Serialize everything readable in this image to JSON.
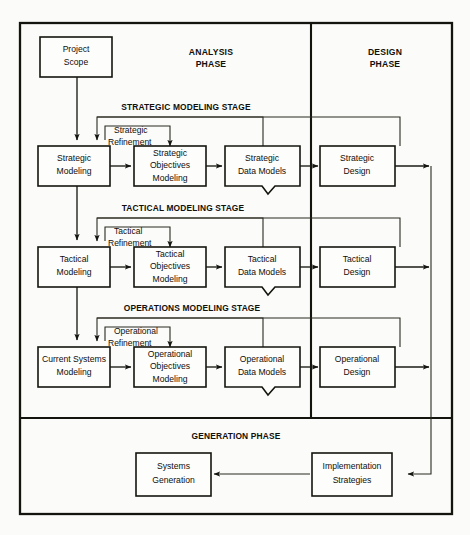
{
  "diagram": {
    "colors": {
      "background": "#fbfbf9",
      "box_fill": "#fdfdfb",
      "line": "#14140f",
      "text": "#100f0b"
    },
    "phases": [
      {
        "id": "analysis",
        "line1": "ANALYSIS",
        "line2": "PHASE"
      },
      {
        "id": "design",
        "line1": "DESIGN",
        "line2": "PHASE"
      }
    ],
    "generation_phase_label": "GENERATION PHASE",
    "stages": [
      {
        "id": "strategic",
        "label": "STRATEGIC MODELING STAGE"
      },
      {
        "id": "tactical",
        "label": "TACTICAL MODELING STAGE"
      },
      {
        "id": "operations",
        "label": "OPERATIONS MODELING STAGE"
      }
    ],
    "refinement_labels": [
      {
        "id": "strategic-refinement",
        "line1": "Strategic",
        "line2": "Refinement"
      },
      {
        "id": "tactical-refinement",
        "line1": "Tactical",
        "line2": "Refinement"
      },
      {
        "id": "operational-refinement",
        "line1": "Operational",
        "line2": "Refinement"
      }
    ],
    "start_box": {
      "id": "project-scope",
      "line1": "Project",
      "line2": "Scope"
    },
    "rows": [
      {
        "id": "strategic-row",
        "modeling": {
          "id": "strategic-modeling",
          "line1": "Strategic",
          "line2": "Modeling",
          "line3": ""
        },
        "objectives": {
          "id": "strategic-objectives-modeling",
          "line1": "Strategic",
          "line2": "Objectives",
          "line3": "Modeling"
        },
        "data_models": {
          "id": "strategic-data-models",
          "line1": "Strategic",
          "line2": "Data Models",
          "line3": ""
        },
        "design": {
          "id": "strategic-design",
          "line1": "Strategic",
          "line2": "Design",
          "line3": ""
        }
      },
      {
        "id": "tactical-row",
        "modeling": {
          "id": "tactical-modeling",
          "line1": "Tactical",
          "line2": "Modeling",
          "line3": ""
        },
        "objectives": {
          "id": "tactical-objectives-modeling",
          "line1": "Tactical",
          "line2": "Objectives",
          "line3": "Modeling"
        },
        "data_models": {
          "id": "tactical-data-models",
          "line1": "Tactical",
          "line2": "Data Models",
          "line3": ""
        },
        "design": {
          "id": "tactical-design",
          "line1": "Tactical",
          "line2": "Design",
          "line3": ""
        }
      },
      {
        "id": "operations-row",
        "modeling": {
          "id": "current-systems-modeling",
          "line1": "Current Systems",
          "line2": "Modeling",
          "line3": ""
        },
        "objectives": {
          "id": "operational-objectives-modeling",
          "line1": "Operational",
          "line2": "Objectives",
          "line3": "Modeling"
        },
        "data_models": {
          "id": "operational-data-models",
          "line1": "Operational",
          "line2": "Data Models",
          "line3": ""
        },
        "design": {
          "id": "operational-design",
          "line1": "Operational",
          "line2": "Design",
          "line3": ""
        }
      }
    ],
    "generation_boxes": [
      {
        "id": "systems-generation",
        "line1": "Systems",
        "line2": "Generation"
      },
      {
        "id": "implementation-strategies",
        "line1": "Implementation",
        "line2": "Strategies"
      }
    ]
  }
}
